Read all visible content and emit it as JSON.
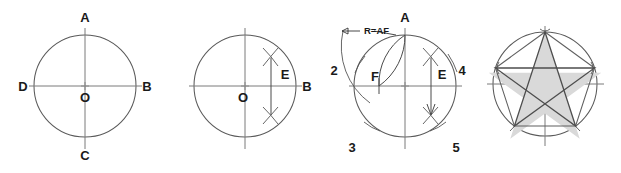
{
  "figure": {
    "background_color": "#ffffff",
    "line_color": "#5a5a5a",
    "shade_color": "#d9d9d9",
    "label_color": "#1a1a1a",
    "width": 621,
    "height": 173
  },
  "panels": [
    {
      "id": "panel-1",
      "name": "step-1-circle-with-diameters",
      "center": {
        "x": 85,
        "y": 86
      },
      "radius": 51,
      "labels": [
        {
          "key": "A",
          "text": "A",
          "x": 85,
          "y": 22,
          "anchor": "middle"
        },
        {
          "key": "B",
          "text": "B",
          "x": 147,
          "y": 91,
          "anchor": "middle"
        },
        {
          "key": "C",
          "text": "C",
          "x": 85,
          "y": 160,
          "anchor": "middle"
        },
        {
          "key": "D",
          "text": "D",
          "x": 23,
          "y": 91,
          "anchor": "middle"
        },
        {
          "key": "O",
          "text": "O",
          "x": 85,
          "y": 102,
          "anchor": "middle"
        }
      ]
    },
    {
      "id": "panel-2",
      "name": "step-2-bisect-radius-ob",
      "center": {
        "x": 245,
        "y": 86
      },
      "radius": 51,
      "labels": [
        {
          "key": "O",
          "text": "O",
          "x": 243,
          "y": 102,
          "anchor": "middle"
        },
        {
          "key": "B",
          "text": "B",
          "x": 307,
          "y": 91,
          "anchor": "middle"
        },
        {
          "key": "E",
          "text": "E",
          "x": 285,
          "y": 79,
          "anchor": "middle"
        }
      ]
    },
    {
      "id": "panel-3",
      "name": "step-3-step-off-pentagon-points",
      "center": {
        "x": 405,
        "y": 86
      },
      "radius": 51,
      "labels": [
        {
          "key": "A",
          "text": "A",
          "x": 405,
          "y": 22,
          "anchor": "middle"
        },
        {
          "key": "F",
          "text": "F",
          "x": 375,
          "y": 81,
          "anchor": "middle"
        },
        {
          "key": "E",
          "text": "E",
          "x": 442,
          "y": 79,
          "anchor": "middle"
        },
        {
          "key": "2",
          "text": "2",
          "x": 334,
          "y": 71,
          "anchor": "middle"
        },
        {
          "key": "3",
          "text": "3",
          "x": 352,
          "y": 149,
          "anchor": "middle"
        },
        {
          "key": "4",
          "text": "4",
          "x": 460,
          "y": 71,
          "anchor": "middle"
        },
        {
          "key": "5",
          "text": "5",
          "x": 455,
          "y": 149,
          "anchor": "middle"
        }
      ],
      "annotation": {
        "text": "R=AF",
        "x": 344,
        "y": 31
      }
    },
    {
      "id": "panel-4",
      "name": "step-4-completed-pentagram",
      "center": {
        "x": 545,
        "y": 84
      },
      "radius": 52,
      "labels": []
    }
  ]
}
